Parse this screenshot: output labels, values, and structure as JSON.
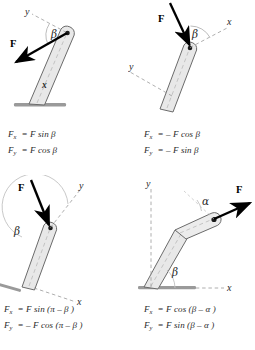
{
  "figure": {
    "colors": {
      "limb_fill": "#e8e8e8",
      "limb_stroke": "#6b6b6b",
      "ground": "#9a9a9a",
      "vector": "#000000",
      "axis_dash": "#9a9a9a",
      "arc": "#b4b4b4",
      "text": "#2a2a2a"
    }
  },
  "panels": [
    {
      "id": "top-left",
      "labels": {
        "force": "F",
        "angle": "β",
        "axis_x": "x",
        "axis_y": "y"
      },
      "equations": [
        {
          "lhs": "F",
          "sub": "x",
          "rhs": "= F sin  β"
        },
        {
          "lhs": "F",
          "sub": "y",
          "rhs": "= F cos  β"
        }
      ],
      "equations_text": [
        "Fx = F sin β",
        "Fy = F cos β"
      ]
    },
    {
      "id": "top-right",
      "labels": {
        "force": "F",
        "angle": "β",
        "axis_x": "x",
        "axis_y": "y"
      },
      "equations": [
        {
          "lhs": "F",
          "sub": "x",
          "rhs": "= – F cos β"
        },
        {
          "lhs": "F",
          "sub": "y",
          "rhs": "= – F sin β"
        }
      ],
      "equations_text": [
        "Fx = – F cos β",
        "Fy = – F sin β"
      ]
    },
    {
      "id": "bottom-left",
      "labels": {
        "force": "F",
        "angle": "β",
        "axis_x": "x",
        "axis_y": "y"
      },
      "equations": [
        {
          "lhs": "F",
          "sub": "x",
          "rhs": "= F sin (π – β )"
        },
        {
          "lhs": "F",
          "sub": "y",
          "rhs": "= – F cos (π – β )"
        }
      ],
      "equations_text": [
        "Fx = F sin(π – β)",
        "Fy = – F cos(π – β)"
      ]
    },
    {
      "id": "bottom-right",
      "labels": {
        "force": "F",
        "angle": "β",
        "angle2": "α",
        "axis_x": "x",
        "axis_y": "y"
      },
      "equations": [
        {
          "lhs": "F",
          "sub": "x",
          "rhs": "= F cos (β – α )"
        },
        {
          "lhs": "F",
          "sub": "y",
          "rhs": "= F sin (β – α )"
        }
      ],
      "equations_text": [
        "Fx = F cos(β – α)",
        "Fy = F sin(β – α)"
      ]
    }
  ]
}
